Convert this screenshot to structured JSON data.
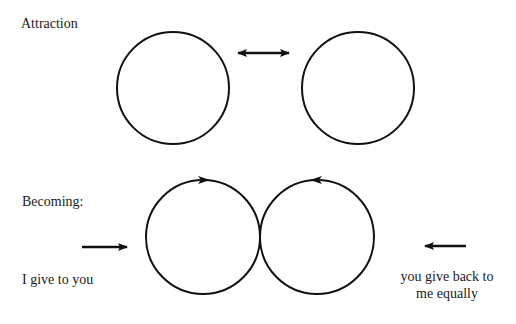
{
  "diagram": {
    "sections": [
      {
        "id": "attraction",
        "title": "Attraction",
        "circles": 2,
        "connector": "double-headed-arrow"
      },
      {
        "id": "becoming",
        "title": "Becoming:",
        "circles": 2,
        "circle_flow": [
          "clockwise-right",
          "counterclockwise-left"
        ],
        "left_caption": "I give to you",
        "right_caption_line1": "you give back to",
        "right_caption_line2": "me equally",
        "left_arrow_direction": "right",
        "right_arrow_direction": "left"
      }
    ],
    "colors": {
      "stroke": "#111111",
      "background": "#ffffff"
    }
  }
}
